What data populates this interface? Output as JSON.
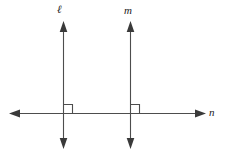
{
  "diagram": {
    "stroke_color": "#4d4d4d",
    "label_color": "#1a1a1a",
    "background_color": "#ffffff",
    "labels": {
      "line_l": "ℓ",
      "line_m": "m",
      "line_n": "n"
    },
    "lines": [
      {
        "name": "line-l",
        "label": "ℓ",
        "orientation": "vertical",
        "x": 63,
        "y_top": 22,
        "y_bottom": 148,
        "arrowheads": [
          "top",
          "bottom"
        ]
      },
      {
        "name": "line-m",
        "label": "m",
        "orientation": "vertical",
        "x": 130,
        "y_top": 22,
        "y_bottom": 148,
        "arrowheads": [
          "top",
          "bottom"
        ]
      },
      {
        "name": "line-n",
        "label": "n",
        "orientation": "horizontal",
        "y": 113,
        "x_left": 10,
        "x_right": 205,
        "arrowheads": [
          "left",
          "right"
        ]
      }
    ],
    "right_angle_marks": [
      {
        "name": "right-angle-l-n",
        "corner_x": 63,
        "corner_y": 113,
        "size": 9,
        "quadrant": "upper-right"
      },
      {
        "name": "right-angle-m-n",
        "corner_x": 130,
        "corner_y": 113,
        "size": 9,
        "quadrant": "upper-right"
      }
    ],
    "intersections": [
      {
        "name": "intersection-l-n",
        "x": 63,
        "y": 113
      },
      {
        "name": "intersection-m-n",
        "x": 130,
        "y": 113
      }
    ]
  }
}
